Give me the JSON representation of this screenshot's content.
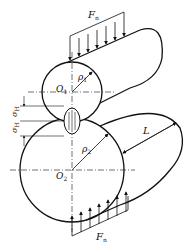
{
  "diagram": {
    "type": "contact-stress-of-two-cylinders",
    "labels": {
      "force_top": "F",
      "force_top_sub": "n",
      "force_bottom": "F",
      "force_bottom_sub": "n",
      "center_upper": "O",
      "center_upper_sub": "1",
      "center_lower": "O",
      "center_lower_sub": "2",
      "radius_upper": "ρ",
      "radius_upper_sub": "1",
      "radius_lower": "ρ",
      "radius_lower_sub": "2",
      "length": "L",
      "stress_upper": "σ",
      "stress_upper_sub": "H",
      "stress_lower": "σ",
      "stress_lower_sub": "H"
    },
    "colors": {
      "stroke": "#111111",
      "background": "#ffffff"
    }
  }
}
